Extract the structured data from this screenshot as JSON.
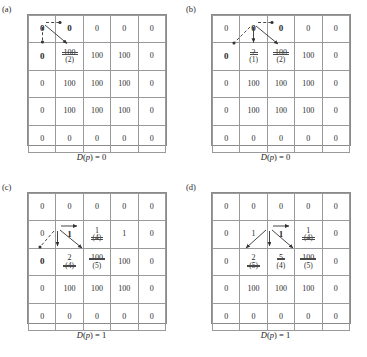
{
  "figure": {
    "type": "diagram"
  },
  "panels": [
    {
      "id": "a",
      "label": "(a)",
      "caption_prefix": "D",
      "caption_arg": "(p)",
      "caption_eq": " = 0",
      "caption_full": "D(p) = 0",
      "grid": [
        [
          {
            "value": "0",
            "bold": true,
            "strike": false,
            "sub": ""
          },
          {
            "value": "0",
            "bold": true,
            "strike": false,
            "sub": ""
          },
          {
            "value": "0",
            "bold": false,
            "strike": false,
            "sub": ""
          },
          {
            "value": "0",
            "bold": false,
            "strike": false,
            "sub": ""
          },
          {
            "value": "0",
            "bold": false,
            "strike": false,
            "sub": ""
          }
        ],
        [
          {
            "value": "0",
            "bold": true,
            "strike": false,
            "sub": ""
          },
          {
            "value": "100",
            "bold": false,
            "strike": true,
            "sub": "(2)"
          },
          {
            "value": "100",
            "bold": false,
            "strike": false,
            "sub": ""
          },
          {
            "value": "100",
            "bold": false,
            "strike": false,
            "sub": ""
          },
          {
            "value": "0",
            "bold": false,
            "strike": false,
            "sub": ""
          }
        ],
        [
          {
            "value": "0",
            "bold": false,
            "strike": false,
            "sub": ""
          },
          {
            "value": "100",
            "bold": false,
            "strike": false,
            "sub": ""
          },
          {
            "value": "100",
            "bold": false,
            "strike": false,
            "sub": ""
          },
          {
            "value": "100",
            "bold": false,
            "strike": false,
            "sub": ""
          },
          {
            "value": "0",
            "bold": false,
            "strike": false,
            "sub": ""
          }
        ],
        [
          {
            "value": "0",
            "bold": false,
            "strike": false,
            "sub": ""
          },
          {
            "value": "100",
            "bold": false,
            "strike": false,
            "sub": ""
          },
          {
            "value": "100",
            "bold": false,
            "strike": false,
            "sub": ""
          },
          {
            "value": "100",
            "bold": false,
            "strike": false,
            "sub": ""
          },
          {
            "value": "0",
            "bold": false,
            "strike": false,
            "sub": ""
          }
        ],
        [
          {
            "value": "0",
            "bold": false,
            "strike": false,
            "sub": ""
          },
          {
            "value": "0",
            "bold": false,
            "strike": false,
            "sub": ""
          },
          {
            "value": "0",
            "bold": false,
            "strike": false,
            "sub": ""
          },
          {
            "value": "0",
            "bold": false,
            "strike": false,
            "sub": ""
          },
          {
            "value": "0",
            "bold": false,
            "strike": false,
            "sub": ""
          }
        ]
      ]
    },
    {
      "id": "b",
      "label": "(b)",
      "caption_full": "D(p) = 0",
      "grid": [
        [
          {
            "value": "0",
            "bold": false,
            "strike": false,
            "sub": ""
          },
          {
            "value": "0",
            "bold": true,
            "strike": false,
            "sub": ""
          },
          {
            "value": "0",
            "bold": true,
            "strike": false,
            "sub": ""
          },
          {
            "value": "0",
            "bold": false,
            "strike": false,
            "sub": ""
          },
          {
            "value": "0",
            "bold": false,
            "strike": false,
            "sub": ""
          }
        ],
        [
          {
            "value": "0",
            "bold": true,
            "strike": false,
            "sub": ""
          },
          {
            "value": "2",
            "bold": false,
            "strike": true,
            "sub": "(1)"
          },
          {
            "value": "100",
            "bold": false,
            "strike": true,
            "sub": "(2)"
          },
          {
            "value": "100",
            "bold": false,
            "strike": false,
            "sub": ""
          },
          {
            "value": "0",
            "bold": false,
            "strike": false,
            "sub": ""
          }
        ],
        [
          {
            "value": "0",
            "bold": false,
            "strike": false,
            "sub": ""
          },
          {
            "value": "100",
            "bold": false,
            "strike": false,
            "sub": ""
          },
          {
            "value": "100",
            "bold": false,
            "strike": false,
            "sub": ""
          },
          {
            "value": "100",
            "bold": false,
            "strike": false,
            "sub": ""
          },
          {
            "value": "0",
            "bold": false,
            "strike": false,
            "sub": ""
          }
        ],
        [
          {
            "value": "0",
            "bold": false,
            "strike": false,
            "sub": ""
          },
          {
            "value": "100",
            "bold": false,
            "strike": false,
            "sub": ""
          },
          {
            "value": "100",
            "bold": false,
            "strike": false,
            "sub": ""
          },
          {
            "value": "100",
            "bold": false,
            "strike": false,
            "sub": ""
          },
          {
            "value": "0",
            "bold": false,
            "strike": false,
            "sub": ""
          }
        ],
        [
          {
            "value": "0",
            "bold": false,
            "strike": false,
            "sub": ""
          },
          {
            "value": "0",
            "bold": false,
            "strike": false,
            "sub": ""
          },
          {
            "value": "0",
            "bold": false,
            "strike": false,
            "sub": ""
          },
          {
            "value": "0",
            "bold": false,
            "strike": false,
            "sub": ""
          },
          {
            "value": "0",
            "bold": false,
            "strike": false,
            "sub": ""
          }
        ]
      ]
    },
    {
      "id": "c",
      "label": "(c)",
      "caption_full": "D(p) = 1",
      "grid": [
        [
          {
            "value": "0",
            "bold": false,
            "strike": false,
            "sub": ""
          },
          {
            "value": "0",
            "bold": false,
            "strike": false,
            "sub": ""
          },
          {
            "value": "0",
            "bold": false,
            "strike": false,
            "sub": ""
          },
          {
            "value": "0",
            "bold": false,
            "strike": false,
            "sub": ""
          },
          {
            "value": "0",
            "bold": false,
            "strike": false,
            "sub": ""
          }
        ],
        [
          {
            "value": "0",
            "bold": false,
            "strike": false,
            "sub": ""
          },
          {
            "value": "1",
            "bold": true,
            "strike": false,
            "sub": ""
          },
          {
            "value": "1",
            "bold": false,
            "strike": false,
            "sub": "(4)",
            "sub_strike": true
          },
          {
            "value": "1",
            "bold": false,
            "strike": false,
            "sub": ""
          },
          {
            "value": "0",
            "bold": false,
            "strike": false,
            "sub": ""
          }
        ],
        [
          {
            "value": "0",
            "bold": true,
            "strike": false,
            "sub": ""
          },
          {
            "value": "2",
            "bold": false,
            "strike": false,
            "sub": "(4)",
            "sub_strike": true
          },
          {
            "value": "100",
            "bold": false,
            "strike": true,
            "sub": "(5)"
          },
          {
            "value": "100",
            "bold": false,
            "strike": false,
            "sub": ""
          },
          {
            "value": "0",
            "bold": false,
            "strike": false,
            "sub": ""
          }
        ],
        [
          {
            "value": "0",
            "bold": false,
            "strike": false,
            "sub": ""
          },
          {
            "value": "100",
            "bold": false,
            "strike": false,
            "sub": ""
          },
          {
            "value": "100",
            "bold": false,
            "strike": false,
            "sub": ""
          },
          {
            "value": "100",
            "bold": false,
            "strike": false,
            "sub": ""
          },
          {
            "value": "0",
            "bold": false,
            "strike": false,
            "sub": ""
          }
        ],
        [
          {
            "value": "0",
            "bold": false,
            "strike": false,
            "sub": ""
          },
          {
            "value": "0",
            "bold": false,
            "strike": false,
            "sub": ""
          },
          {
            "value": "0",
            "bold": false,
            "strike": false,
            "sub": ""
          },
          {
            "value": "0",
            "bold": false,
            "strike": false,
            "sub": ""
          },
          {
            "value": "0",
            "bold": false,
            "strike": false,
            "sub": ""
          }
        ]
      ]
    },
    {
      "id": "d",
      "label": "(d)",
      "caption_full": "D(p) = 1",
      "grid": [
        [
          {
            "value": "0",
            "bold": false,
            "strike": false,
            "sub": ""
          },
          {
            "value": "0",
            "bold": false,
            "strike": false,
            "sub": ""
          },
          {
            "value": "0",
            "bold": false,
            "strike": false,
            "sub": ""
          },
          {
            "value": "0",
            "bold": false,
            "strike": false,
            "sub": ""
          },
          {
            "value": "0",
            "bold": false,
            "strike": false,
            "sub": ""
          }
        ],
        [
          {
            "value": "0",
            "bold": false,
            "strike": false,
            "sub": ""
          },
          {
            "value": "1",
            "bold": false,
            "strike": false,
            "sub": ""
          },
          {
            "value": "1",
            "bold": true,
            "strike": false,
            "sub": ""
          },
          {
            "value": "1",
            "bold": false,
            "strike": false,
            "sub": "(4)",
            "sub_strike": true
          },
          {
            "value": "0",
            "bold": false,
            "strike": false,
            "sub": ""
          }
        ],
        [
          {
            "value": "0",
            "bold": false,
            "strike": false,
            "sub": ""
          },
          {
            "value": "2",
            "bold": false,
            "strike": false,
            "sub": "(5)",
            "sub_strike": true
          },
          {
            "value": "5",
            "bold": false,
            "strike": true,
            "sub": "(4)"
          },
          {
            "value": "100",
            "bold": false,
            "strike": true,
            "sub": "(5)"
          },
          {
            "value": "0",
            "bold": false,
            "strike": false,
            "sub": ""
          }
        ],
        [
          {
            "value": "0",
            "bold": false,
            "strike": false,
            "sub": ""
          },
          {
            "value": "100",
            "bold": false,
            "strike": false,
            "sub": ""
          },
          {
            "value": "100",
            "bold": false,
            "strike": false,
            "sub": ""
          },
          {
            "value": "100",
            "bold": false,
            "strike": false,
            "sub": ""
          },
          {
            "value": "0",
            "bold": false,
            "strike": false,
            "sub": ""
          }
        ],
        [
          {
            "value": "0",
            "bold": false,
            "strike": false,
            "sub": ""
          },
          {
            "value": "0",
            "bold": false,
            "strike": false,
            "sub": ""
          },
          {
            "value": "0",
            "bold": false,
            "strike": false,
            "sub": ""
          },
          {
            "value": "0",
            "bold": false,
            "strike": false,
            "sub": ""
          },
          {
            "value": "0",
            "bold": false,
            "strike": false,
            "sub": ""
          }
        ]
      ]
    }
  ],
  "colors": {
    "grid_line": "#9a9a9a",
    "grid_border": "#8a8a8a",
    "text": "#2b2b2b",
    "arrow": "#333333",
    "strike": "#4a4a4a"
  }
}
